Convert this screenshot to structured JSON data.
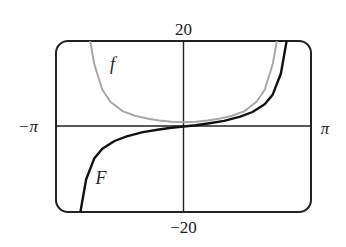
{
  "chart_data": {
    "type": "line",
    "title": "",
    "xlabel": "",
    "ylabel": "",
    "xlim": [
      -3.14159,
      3.14159
    ],
    "ylim": [
      -20,
      20
    ],
    "grid": false,
    "legend": "inline labels",
    "tick_labels": {
      "x_min": "−π",
      "x_max": "π",
      "y_max": "20",
      "y_min": "−20"
    },
    "series": [
      {
        "name": "f",
        "color": "#a8a8a8",
        "description": "even function, minimum ≈1 at x=0, vertical asymptote-like rise near x≈±2.3",
        "x": [
          -2.3,
          -2.2,
          -2.0,
          -1.8,
          -1.5,
          -1.2,
          -0.9,
          -0.6,
          -0.3,
          0,
          0.3,
          0.6,
          0.9,
          1.2,
          1.5,
          1.8,
          2.0,
          2.2,
          2.3
        ],
        "y": [
          20.0,
          14.7,
          8.6,
          5.8,
          3.6,
          2.5,
          1.9,
          1.4,
          1.1,
          1.0,
          1.1,
          1.4,
          1.9,
          2.5,
          3.6,
          5.8,
          8.6,
          14.7,
          20.0
        ]
      },
      {
        "name": "F",
        "color": "#111111",
        "description": "odd increasing antiderivative of f, passes through origin",
        "x": [
          -2.54,
          -2.4,
          -2.2,
          -2.0,
          -1.7,
          -1.4,
          -1.0,
          -0.6,
          -0.3,
          0,
          0.3,
          0.6,
          1.0,
          1.4,
          1.7,
          2.0,
          2.2,
          2.4,
          2.54
        ],
        "y": [
          -20.0,
          -12.4,
          -7.5,
          -5.2,
          -3.4,
          -2.3,
          -1.3,
          -0.7,
          -0.3,
          0.0,
          0.3,
          0.7,
          1.3,
          2.3,
          3.4,
          5.2,
          7.5,
          12.4,
          20.0
        ]
      }
    ],
    "annotations": [
      {
        "text": "f",
        "x": -1.75,
        "y": 13.2
      },
      {
        "text": "F",
        "x": -2.03,
        "y": -13.4
      }
    ]
  }
}
